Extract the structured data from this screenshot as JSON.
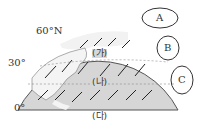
{
  "diagram": {
    "latitude_labels": [
      "60°N",
      "30°",
      "0°"
    ],
    "belt_labels": [
      "(가)",
      "(나)",
      "(다)"
    ],
    "cell_labels": [
      "A",
      "B",
      "C"
    ],
    "colors": {
      "ocean": "#d6d6d6",
      "land": "#ffffff",
      "outline": "#555555",
      "arrow": "#222222"
    }
  }
}
